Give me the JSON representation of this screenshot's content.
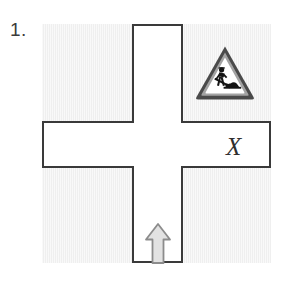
{
  "figure": {
    "number_label": "1.",
    "type": "road-intersection-diagram"
  },
  "colors": {
    "background": "#ffffff",
    "block_fill": "#efefef",
    "line": "#3a3a3a",
    "road": "#ffffff",
    "sign_outer_border": "#4a4a4a",
    "sign_inner_border": "#9a9a9a",
    "sign_face": "#ffffff",
    "pictogram": "#141414",
    "arrow_fill": "#e0e0e0",
    "arrow_stroke": "#8c8c8c",
    "text": "#2f2f2f"
  },
  "map": {
    "frame": {
      "name": "map-frame"
    },
    "blocks": [
      {
        "id": "top-left",
        "name": "block-top-left",
        "label": ""
      },
      {
        "id": "top-right",
        "name": "block-top-right",
        "label": ""
      },
      {
        "id": "bottom-left",
        "name": "block-bottom-left",
        "label": ""
      },
      {
        "id": "bottom-right",
        "name": "block-bottom-right",
        "label": ""
      }
    ],
    "roads": {
      "vertical": "north-south road",
      "horizontal": "east-west road"
    }
  },
  "markings": {
    "sign": {
      "name": "roadworks-warning-sign",
      "shape": "triangle",
      "meaning": "Road works ahead",
      "location": "top-right block"
    },
    "x_mark": {
      "text": "X",
      "location": "east road arm"
    },
    "arrow": {
      "name": "direction-arrow-up",
      "direction": "north",
      "location": "south road arm"
    }
  }
}
